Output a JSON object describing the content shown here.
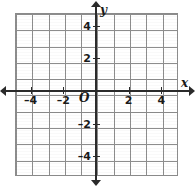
{
  "figure": {
    "kind": "cartesian-coordinate-grid",
    "background_color": "#ffffff",
    "grid_color": "#8d8d8d",
    "axis_color": "#2b2b2b",
    "label_color": "#1a1a1a"
  },
  "axes": {
    "x_name": "x",
    "y_name": "y",
    "origin_label": "O"
  },
  "chart_data": {
    "type": "scatter",
    "title": "",
    "xlabel": "x",
    "ylabel": "y",
    "xlim": [
      -5,
      5
    ],
    "ylim": [
      -5,
      5
    ],
    "grid": true,
    "grid_step": 1,
    "legend": "none",
    "series": [
      {
        "name": "plotted-points",
        "x": [],
        "y": []
      }
    ],
    "xticks": [
      -4,
      -2,
      2,
      4
    ],
    "yticks": [
      -4,
      -2,
      2,
      4
    ],
    "xtick_labels": [
      "–4",
      "–2",
      "2",
      "4"
    ],
    "ytick_labels": [
      "–4",
      "–2",
      "2",
      "4"
    ],
    "origin_label": "O",
    "annotations": []
  },
  "x_ticks": [
    {
      "value": -4,
      "label": "–4",
      "px": 30.7
    },
    {
      "value": -2,
      "label": "–2",
      "px": 63.4
    },
    {
      "value": 2,
      "label": "2",
      "px": 128.6
    },
    {
      "value": 4,
      "label": "4",
      "px": 161.3
    }
  ],
  "y_ticks": [
    {
      "value": 4,
      "label": "4",
      "py": 25.8
    },
    {
      "value": 2,
      "label": "2",
      "py": 58.4
    },
    {
      "value": -2,
      "label": "–2",
      "py": 123.6
    },
    {
      "value": -4,
      "label": "–4",
      "py": 156.2
    }
  ]
}
